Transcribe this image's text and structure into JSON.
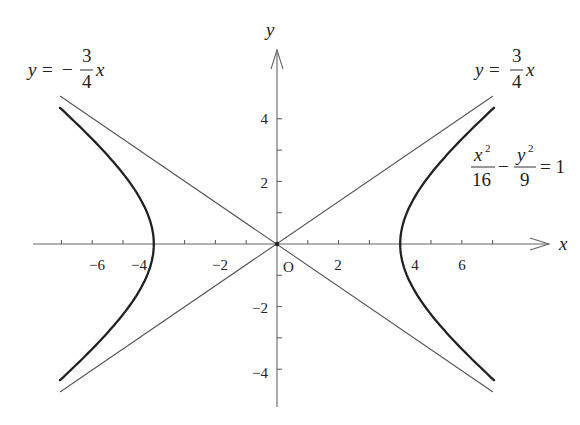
{
  "figure": {
    "x_axis_label": "x",
    "y_axis_label": "y",
    "origin_label": "O",
    "x_tick_labels": [
      {
        "value": -6,
        "text": "−6"
      },
      {
        "value": -4,
        "text": "−4"
      },
      {
        "value": -2,
        "text": "−2"
      },
      {
        "value": 2,
        "text": "2"
      },
      {
        "value": 4,
        "text": "4"
      },
      {
        "value": 6,
        "text": "6"
      }
    ],
    "y_tick_labels": [
      {
        "value": 4,
        "text": "4"
      },
      {
        "value": 2,
        "text": "2"
      },
      {
        "value": -2,
        "text": "−2"
      },
      {
        "value": -4,
        "text": "−4"
      }
    ],
    "asymptote_left": {
      "lhs": "y",
      "eq": "=",
      "sign": "−",
      "num": "3",
      "den": "4",
      "var": "x"
    },
    "asymptote_right": {
      "lhs": "y",
      "eq": "=",
      "num": "3",
      "den": "4",
      "var": "x"
    },
    "equation": {
      "term1_num": "x",
      "term1_exp": "2",
      "term1_den": "16",
      "minus": "−",
      "term2_num": "y",
      "term2_exp": "2",
      "term2_den": "9",
      "rhs": "= 1"
    },
    "colors": {
      "curve": "#222222",
      "axis": "#666666",
      "asymptote": "#555555"
    }
  },
  "chart_data": {
    "type": "line",
    "xlabel": "x",
    "ylabel": "y",
    "xlim": [
      -7.5,
      8.5
    ],
    "ylim": [
      -5,
      6
    ],
    "x_ticks": [
      -7,
      -6,
      -5,
      -4,
      -3,
      -2,
      -1,
      1,
      2,
      3,
      4,
      5,
      6,
      7
    ],
    "y_ticks": [
      -4,
      -3,
      -2,
      -1,
      1,
      2,
      3,
      4
    ],
    "grid": false,
    "series": [
      {
        "name": "hyperbola right branch",
        "equation": "x^2/16 - y^2/9 = 1",
        "x": [
          4,
          4.5,
          5,
          5.5,
          6,
          6.5,
          7
        ],
        "y_pos": [
          0,
          1.55,
          2.25,
          2.83,
          3.35,
          3.84,
          4.31
        ]
      },
      {
        "name": "hyperbola left branch",
        "equation": "x^2/16 - y^2/9 = 1",
        "x": [
          -4,
          -4.5,
          -5,
          -5.5,
          -6,
          -6.5,
          -7
        ],
        "y_pos": [
          0,
          1.55,
          2.25,
          2.83,
          3.35,
          3.84,
          4.31
        ]
      },
      {
        "name": "asymptote y = 3/4 x",
        "x": [
          -7,
          7
        ],
        "y": [
          -5.25,
          5.25
        ]
      },
      {
        "name": "asymptote y = -3/4 x",
        "x": [
          -7,
          7
        ],
        "y": [
          5.25,
          -5.25
        ]
      }
    ],
    "vertices": [
      [
        -4,
        0
      ],
      [
        4,
        0
      ]
    ],
    "annotations": [
      "y = −(3/4)x",
      "y = (3/4)x",
      "x²/16 − y²/9 = 1",
      "O"
    ]
  }
}
